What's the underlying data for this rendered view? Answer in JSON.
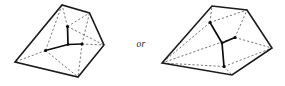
{
  "figure": {
    "connector_label": "or",
    "colors": {
      "hull_stroke": "#1a1a1a",
      "dashed_stroke": "#4a4a4a",
      "tripod_stroke": "#0d0d0d",
      "node_fill": "#0d0d0d",
      "background": "#ffffff"
    },
    "left_diagram": {
      "name": "left-polytope",
      "hull_vertices": [
        {
          "label": "v1",
          "x": 15.0,
          "y": 62.0
        },
        {
          "label": "v2",
          "x": 62.0,
          "y": 5.0
        },
        {
          "label": "v3",
          "x": 89.5,
          "y": 13.0
        },
        {
          "label": "v4",
          "x": 104.0,
          "y": 45.0
        },
        {
          "label": "v5",
          "x": 78.0,
          "y": 77.0
        }
      ],
      "tripod_center": {
        "label": "c",
        "x": 68.0,
        "y": 44.5
      },
      "tripod_tips": [
        {
          "label": "t1",
          "x": 67.5,
          "y": 26.5
        },
        {
          "label": "t2",
          "x": 45.5,
          "y": 50.5
        },
        {
          "label": "t3",
          "x": 82.0,
          "y": 44.0
        }
      ],
      "dashed_connections": [
        {
          "from": "t1",
          "to": "v2"
        },
        {
          "from": "t1",
          "to": "v3"
        },
        {
          "from": "t1",
          "to": "v4"
        },
        {
          "from": "t2",
          "to": "v1"
        },
        {
          "from": "t2",
          "to": "v2"
        },
        {
          "from": "t2",
          "to": "v5"
        },
        {
          "from": "t3",
          "to": "v3"
        },
        {
          "from": "t3",
          "to": "v4"
        },
        {
          "from": "t3",
          "to": "v5"
        }
      ]
    },
    "right_diagram": {
      "name": "right-polytope",
      "hull_vertices": [
        {
          "label": "w1",
          "x": 162.0,
          "y": 63.0
        },
        {
          "label": "w2",
          "x": 212.0,
          "y": 6.0
        },
        {
          "label": "w3",
          "x": 247.0,
          "y": 10.0
        },
        {
          "label": "w4",
          "x": 272.0,
          "y": 48.0
        },
        {
          "label": "w5",
          "x": 232.0,
          "y": 75.0
        }
      ],
      "tripod_center": {
        "label": "d",
        "x": 222.0,
        "y": 43.0
      },
      "tripod_tips": [
        {
          "label": "u1",
          "x": 210.0,
          "y": 22.5
        },
        {
          "label": "u2",
          "x": 235.0,
          "y": 37.5
        },
        {
          "label": "u3",
          "x": 224.0,
          "y": 66.5
        }
      ],
      "dashed_connections": [
        {
          "from": "u1",
          "to": "w2"
        },
        {
          "from": "u1",
          "to": "w3"
        },
        {
          "from": "u1",
          "to": "w1"
        },
        {
          "from": "u2",
          "to": "w3"
        },
        {
          "from": "u2",
          "to": "w4"
        },
        {
          "from": "u2",
          "to": "w1"
        },
        {
          "from": "u3",
          "to": "w4"
        },
        {
          "from": "u3",
          "to": "w5"
        },
        {
          "from": "u3",
          "to": "w1"
        }
      ]
    },
    "connector_position": {
      "x": 141.0,
      "y": 45.0
    }
  }
}
